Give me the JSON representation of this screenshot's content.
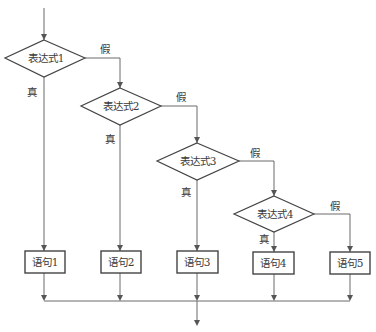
{
  "diagram": {
    "type": "flowchart",
    "colors": {
      "line": "#6a6a6a",
      "box_border": "#444444",
      "text": "#3a3a3a",
      "background": "#ffffff"
    },
    "decisions": [
      {
        "id": "d1",
        "label": "表达式1",
        "true_label": "真",
        "false_label": "假"
      },
      {
        "id": "d2",
        "label": "表达式2",
        "true_label": "真",
        "false_label": "假"
      },
      {
        "id": "d3",
        "label": "表达式3",
        "true_label": "真",
        "false_label": "假"
      },
      {
        "id": "d4",
        "label": "表达式4",
        "true_label": "真",
        "false_label": "假"
      }
    ],
    "statements": [
      {
        "id": "s1",
        "label": "语句1"
      },
      {
        "id": "s2",
        "label": "语句2"
      },
      {
        "id": "s3",
        "label": "语句3"
      },
      {
        "id": "s4",
        "label": "语句4"
      },
      {
        "id": "s5",
        "label": "语句5"
      }
    ]
  }
}
